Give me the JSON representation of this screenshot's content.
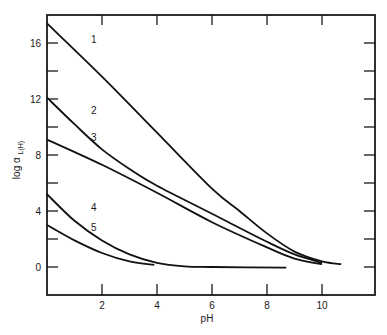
{
  "chart_data": {
    "type": "line",
    "title": "",
    "xlabel": "pH",
    "ylabel": "log α L(H)",
    "ylabel_main": "log α",
    "ylabel_sub": "L(H)",
    "xlim": [
      0,
      11.05
    ],
    "ylim": [
      -2,
      18
    ],
    "x_ticks": [
      2,
      4,
      6,
      8,
      10
    ],
    "y_ticks": [
      0,
      4,
      8,
      12,
      16
    ],
    "x_tick_labels": [
      "2",
      "4",
      "6",
      "8",
      "10"
    ],
    "y_tick_labels": [
      "0",
      "4",
      "8",
      "12",
      "16"
    ],
    "grid": false,
    "legend": "inline curve numbers",
    "series": [
      {
        "name": "1",
        "x": [
          0,
          2,
          4,
          6,
          7,
          8,
          9,
          10,
          10.7
        ],
        "values": [
          17.4,
          13.6,
          9.6,
          5.6,
          4.0,
          2.4,
          1.1,
          0.4,
          0.2
        ],
        "label_pos": [
          1.6,
          16.0
        ]
      },
      {
        "name": "2",
        "x": [
          0,
          1,
          2,
          3,
          4,
          6,
          8,
          9,
          10
        ],
        "values": [
          12.1,
          10.2,
          8.4,
          7.0,
          5.8,
          3.8,
          1.8,
          0.9,
          0.3
        ],
        "label_pos": [
          1.6,
          10.9
        ]
      },
      {
        "name": "3",
        "x": [
          0,
          2,
          4,
          6,
          8,
          9,
          10
        ],
        "values": [
          9.1,
          7.3,
          5.3,
          3.2,
          1.4,
          0.6,
          0.2
        ],
        "label_pos": [
          1.6,
          9.0
        ]
      },
      {
        "name": "4",
        "x": [
          0,
          1,
          2,
          3,
          4,
          5,
          6,
          8.7
        ],
        "values": [
          5.2,
          3.3,
          1.9,
          0.9,
          0.3,
          0.05,
          0.0,
          -0.05
        ],
        "label_pos": [
          1.6,
          4.0
        ]
      },
      {
        "name": "5",
        "x": [
          0,
          1,
          2,
          3,
          3.9
        ],
        "values": [
          3.0,
          1.9,
          1.0,
          0.4,
          0.15
        ],
        "label_pos": [
          1.6,
          2.6
        ]
      }
    ]
  }
}
